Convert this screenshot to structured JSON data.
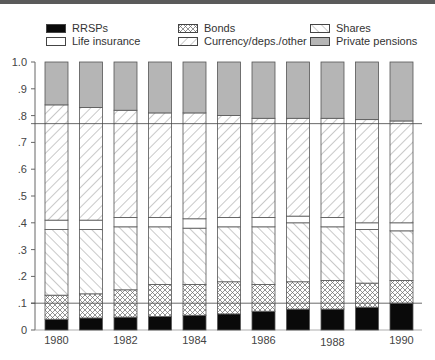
{
  "chart_data": {
    "type": "bar",
    "stacked": true,
    "normalized": true,
    "title": "",
    "xlabel": "",
    "ylabel": "",
    "ylim": [
      0,
      1.0
    ],
    "yticks": [
      "0",
      ".1",
      ".2",
      ".3",
      ".4",
      ".5",
      ".6",
      ".7",
      ".8",
      ".9",
      "1.0"
    ],
    "xtick_labels": [
      "1980",
      "1982",
      "1984",
      "1986",
      "1988",
      "1990"
    ],
    "categories": [
      "1980",
      "1981",
      "1982",
      "1983",
      "1984",
      "1985",
      "1986",
      "1987",
      "1988",
      "1989",
      "1990"
    ],
    "legend_position": "top",
    "grid": false,
    "reference_lines": [
      0.1,
      0.77
    ],
    "series": [
      {
        "name": "RRSPs",
        "pattern": "solid-black",
        "values": [
          0.04,
          0.045,
          0.048,
          0.05,
          0.055,
          0.06,
          0.07,
          0.078,
          0.078,
          0.085,
          0.1
        ]
      },
      {
        "name": "Bonds",
        "pattern": "crosshatch",
        "values": [
          0.09,
          0.09,
          0.102,
          0.12,
          0.115,
          0.12,
          0.1,
          0.102,
          0.107,
          0.09,
          0.085
        ]
      },
      {
        "name": "Shares",
        "pattern": "back-diagonal",
        "values": [
          0.245,
          0.24,
          0.235,
          0.215,
          0.21,
          0.205,
          0.215,
          0.22,
          0.2,
          0.2,
          0.185
        ]
      },
      {
        "name": "Life insurance",
        "pattern": "white",
        "values": [
          0.035,
          0.035,
          0.035,
          0.035,
          0.035,
          0.035,
          0.035,
          0.025,
          0.035,
          0.025,
          0.03
        ]
      },
      {
        "name": "Currency/deps./other",
        "pattern": "forward-diagonal",
        "values": [
          0.43,
          0.42,
          0.4,
          0.39,
          0.395,
          0.38,
          0.37,
          0.365,
          0.37,
          0.385,
          0.38
        ]
      },
      {
        "name": "Private pensions",
        "pattern": "gray",
        "values": [
          0.16,
          0.17,
          0.18,
          0.19,
          0.19,
          0.2,
          0.21,
          0.21,
          0.21,
          0.215,
          0.22
        ]
      }
    ]
  },
  "legend": {
    "items": [
      {
        "label": "RRSPs",
        "pattern": "solid-black"
      },
      {
        "label": "Bonds",
        "pattern": "crosshatch"
      },
      {
        "label": "Shares",
        "pattern": "back-diagonal"
      },
      {
        "label": "Life insurance",
        "pattern": "white"
      },
      {
        "label": "Currency/deps./other",
        "pattern": "forward-diagonal"
      },
      {
        "label": "Private pensions",
        "pattern": "gray"
      }
    ]
  },
  "colors": {
    "black": "#0a0a0a",
    "gray": "#b5b5b5",
    "line": "#555555",
    "hatch": "#777777"
  }
}
